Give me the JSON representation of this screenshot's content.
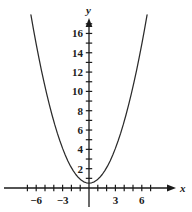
{
  "chart_data": {
    "type": "line",
    "title": "",
    "xlabel": "x",
    "ylabel": "y",
    "equation": "y = 0.4x^2 + 0.5",
    "curve_label": "parabola",
    "xlim": [
      -7.6,
      7.6
    ],
    "ylim": [
      -1.3,
      18.5
    ],
    "grid": false,
    "legend": null,
    "axes_style": "arrowed-cartesian",
    "x_ticks": [
      -7,
      -6,
      -5,
      -4,
      -3,
      -2,
      -1,
      0,
      1,
      2,
      3,
      4,
      5,
      6,
      7
    ],
    "x_tick_labels": [
      {
        "value": -6,
        "text": "−6"
      },
      {
        "value": -3,
        "text": "−3"
      },
      {
        "value": 3,
        "text": "3"
      },
      {
        "value": 6,
        "text": "6"
      }
    ],
    "y_ticks": [
      1,
      2,
      3,
      4,
      5,
      6,
      7,
      8,
      9,
      10,
      11,
      12,
      13,
      14,
      15,
      16,
      17
    ],
    "y_tick_labels": [
      {
        "value": 2,
        "text": "2"
      },
      {
        "value": 4,
        "text": "4"
      },
      {
        "value": 6,
        "text": "6"
      },
      {
        "value": 8,
        "text": "8"
      },
      {
        "value": 10,
        "text": "10"
      },
      {
        "value": 12,
        "text": "12"
      },
      {
        "value": 14,
        "text": "14"
      },
      {
        "value": 16,
        "text": "16"
      }
    ],
    "vertex": {
      "x": 0,
      "y": 0.5
    },
    "x": [
      -6.6,
      -6.3,
      -6.0,
      -5.7,
      -5.4,
      -5.1,
      -4.8,
      -4.5,
      -4.2,
      -3.9,
      -3.6,
      -3.3,
      -3.0,
      -2.7,
      -2.4,
      -2.1,
      -1.8,
      -1.5,
      -1.2,
      -0.9,
      -0.6,
      -0.3,
      0.0,
      0.3,
      0.6,
      0.9,
      1.2,
      1.5,
      1.8,
      2.1,
      2.4,
      2.7,
      3.0,
      3.3,
      3.6,
      3.9,
      4.2,
      4.5,
      4.8,
      5.1,
      5.4,
      5.7,
      6.0,
      6.3,
      6.6
    ],
    "y": [
      17.92,
      16.38,
      14.9,
      13.5,
      12.16,
      10.9,
      9.72,
      8.6,
      7.56,
      6.58,
      5.68,
      4.86,
      4.1,
      3.42,
      2.8,
      2.26,
      1.8,
      1.4,
      1.08,
      0.82,
      0.64,
      0.54,
      0.5,
      0.54,
      0.64,
      0.82,
      1.08,
      1.4,
      1.8,
      2.26,
      2.8,
      3.42,
      4.1,
      4.86,
      5.68,
      6.58,
      7.56,
      8.6,
      9.72,
      10.9,
      12.16,
      13.5,
      14.9,
      16.38,
      17.92
    ],
    "colors": {
      "curve": "#2b2b2b",
      "axis": "#1a1a1a",
      "background": "#ffffff",
      "text": "#1a1a1a"
    }
  }
}
